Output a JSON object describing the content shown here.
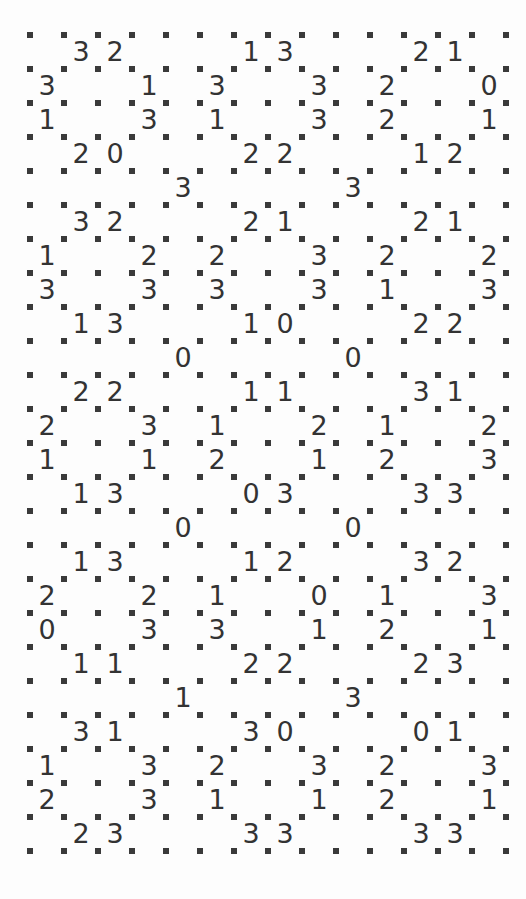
{
  "puzzle": {
    "name": "slitherlink-grid",
    "type": "slitherlink",
    "cols": 14,
    "rows": 24,
    "dot_cols": 15,
    "dot_rows": 25,
    "origin_x": 30,
    "origin_y": 35,
    "spacing": 34,
    "dot_size": 6,
    "dot_color": "#3a3a3a",
    "clue_color": "#333333",
    "background": "#fdfdfd",
    "clues": [
      [
        null,
        "3",
        "2",
        null,
        null,
        null,
        "1",
        "3",
        null,
        null,
        null,
        "2",
        "1",
        null
      ],
      [
        "3",
        null,
        null,
        "1",
        null,
        "3",
        null,
        null,
        "3",
        null,
        "2",
        null,
        null,
        "0"
      ],
      [
        "1",
        null,
        null,
        "3",
        null,
        "1",
        null,
        null,
        "3",
        null,
        "2",
        null,
        null,
        "1"
      ],
      [
        null,
        "2",
        "0",
        null,
        null,
        null,
        "2",
        "2",
        null,
        null,
        null,
        "1",
        "2",
        null
      ],
      [
        null,
        null,
        null,
        null,
        "3",
        null,
        null,
        null,
        null,
        "3",
        null,
        null,
        null,
        null
      ],
      [
        null,
        "3",
        "2",
        null,
        null,
        null,
        "2",
        "1",
        null,
        null,
        null,
        "2",
        "1",
        null
      ],
      [
        "1",
        null,
        null,
        "2",
        null,
        "2",
        null,
        null,
        "3",
        null,
        "2",
        null,
        null,
        "2"
      ],
      [
        "3",
        null,
        null,
        "3",
        null,
        "3",
        null,
        null,
        "3",
        null,
        "1",
        null,
        null,
        "3"
      ],
      [
        null,
        "1",
        "3",
        null,
        null,
        null,
        "1",
        "0",
        null,
        null,
        null,
        "2",
        "2",
        null
      ],
      [
        null,
        null,
        null,
        null,
        "0",
        null,
        null,
        null,
        null,
        "0",
        null,
        null,
        null,
        null
      ],
      [
        null,
        "2",
        "2",
        null,
        null,
        null,
        "1",
        "1",
        null,
        null,
        null,
        "3",
        "1",
        null
      ],
      [
        "2",
        null,
        null,
        "3",
        null,
        "1",
        null,
        null,
        "2",
        null,
        "1",
        null,
        null,
        "2"
      ],
      [
        "1",
        null,
        null,
        "1",
        null,
        "2",
        null,
        null,
        "1",
        null,
        "2",
        null,
        null,
        "3"
      ],
      [
        null,
        "1",
        "3",
        null,
        null,
        null,
        "0",
        "3",
        null,
        null,
        null,
        "3",
        "3",
        null
      ],
      [
        null,
        null,
        null,
        null,
        "0",
        null,
        null,
        null,
        null,
        "0",
        null,
        null,
        null,
        null
      ],
      [
        null,
        "1",
        "3",
        null,
        null,
        null,
        "1",
        "2",
        null,
        null,
        null,
        "3",
        "2",
        null
      ],
      [
        "2",
        null,
        null,
        "2",
        null,
        "1",
        null,
        null,
        "0",
        null,
        "1",
        null,
        null,
        "3"
      ],
      [
        "0",
        null,
        null,
        "3",
        null,
        "3",
        null,
        null,
        "1",
        null,
        "2",
        null,
        null,
        "1"
      ],
      [
        null,
        "1",
        "1",
        null,
        null,
        null,
        "2",
        "2",
        null,
        null,
        null,
        "2",
        "3",
        null
      ],
      [
        null,
        null,
        null,
        null,
        "1",
        null,
        null,
        null,
        null,
        "3",
        null,
        null,
        null,
        null
      ],
      [
        null,
        "3",
        "1",
        null,
        null,
        null,
        "3",
        "0",
        null,
        null,
        null,
        "0",
        "1",
        null
      ],
      [
        "1",
        null,
        null,
        "3",
        null,
        "2",
        null,
        null,
        "3",
        null,
        "2",
        null,
        null,
        "3"
      ],
      [
        "2",
        null,
        null,
        "3",
        null,
        "1",
        null,
        null,
        "1",
        null,
        "2",
        null,
        null,
        "1"
      ],
      [
        null,
        "2",
        "3",
        null,
        null,
        null,
        "3",
        "3",
        null,
        null,
        null,
        "3",
        "3",
        null
      ]
    ]
  }
}
